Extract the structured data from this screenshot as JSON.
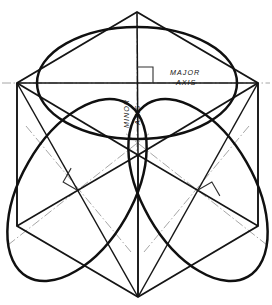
{
  "figure": {
    "background_color": "#ffffff",
    "line_color": "#151515",
    "center_line_color": "#9a9a9a",
    "construction_line_color": "#2a2a2a",
    "width": 272,
    "height": 305,
    "masthead_text": ""
  },
  "labels": {
    "major_axis_line1": "MAJOR",
    "major_axis_line2": "AXIS",
    "minor_axis_line1": "MINOR",
    "minor_axis_line2": "AXIS"
  },
  "geometry": {
    "hexagon_vertices": [
      {
        "name": "top",
        "x": 137,
        "y": 12
      },
      {
        "name": "upper-right",
        "x": 258,
        "y": 83
      },
      {
        "name": "lower-right",
        "x": 258,
        "y": 226
      },
      {
        "name": "bottom",
        "x": 138,
        "y": 297
      },
      {
        "name": "lower-left",
        "x": 17,
        "y": 226
      },
      {
        "name": "upper-left",
        "x": 17,
        "y": 83
      }
    ],
    "cube_center": {
      "x": 138,
      "y": 155
    },
    "ellipses": [
      {
        "name": "top-face-ellipse",
        "cx": 137,
        "cy": 83,
        "rx": 100,
        "ry": 56,
        "rotation_deg": 0,
        "major_axis_px": 200,
        "minor_axis_px": 112
      },
      {
        "name": "left-face-ellipse",
        "cx": 77,
        "cy": 190,
        "rx": 100,
        "ry": 56,
        "rotation_deg": -60,
        "major_axis_px": 200,
        "minor_axis_px": 112
      },
      {
        "name": "right-face-ellipse",
        "cx": 198,
        "cy": 190,
        "rx": 100,
        "ry": 56,
        "rotation_deg": 60,
        "major_axis_px": 200,
        "minor_axis_px": 112
      }
    ],
    "right_angle_markers": [
      {
        "name": "top-face-right-angle",
        "x": 137,
        "y": 83,
        "rotation_deg": 0
      },
      {
        "name": "left-face-right-angle",
        "x": 77,
        "y": 190,
        "rotation_deg": -60
      },
      {
        "name": "right-face-right-angle",
        "x": 198,
        "y": 190,
        "rotation_deg": 60
      }
    ]
  }
}
